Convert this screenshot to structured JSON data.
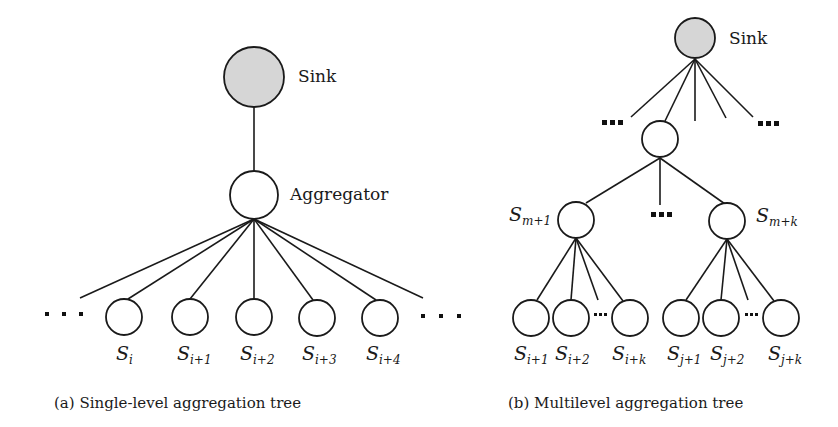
{
  "colors": {
    "sink_fill": "#d6d6d6",
    "node_fill": "#ffffff",
    "stroke": "#1a1a1a"
  },
  "diagram_a": {
    "caption": "(a) Single-level aggregation tree",
    "sink": {
      "label": "Sink",
      "cx": 254,
      "cy": 77,
      "r": 30
    },
    "aggregator": {
      "label": "Aggregator",
      "cx": 254,
      "cy": 195,
      "r": 24
    },
    "leaves": [
      {
        "cx": 124,
        "cy": 317,
        "r": 18,
        "var": "S",
        "sub": "i"
      },
      {
        "cx": 190,
        "cy": 317,
        "r": 18,
        "var": "S",
        "sub": "i+1"
      },
      {
        "cx": 254,
        "cy": 317,
        "r": 18,
        "var": "S",
        "sub": "i+2"
      },
      {
        "cx": 317,
        "cy": 318,
        "r": 18,
        "var": "S",
        "sub": "i+3"
      },
      {
        "cx": 380,
        "cy": 318,
        "r": 18,
        "var": "S",
        "sub": "i+4"
      }
    ],
    "ellipsis_left": "...",
    "ellipsis_right": "..."
  },
  "diagram_b": {
    "caption": "(b) Multilevel aggregation tree",
    "sink": {
      "label": "Sink",
      "cx": 695,
      "cy": 38,
      "r": 20
    },
    "intermediate": {
      "cx": 660,
      "cy": 139,
      "r": 18
    },
    "cluster_heads": [
      {
        "cx": 576,
        "cy": 220,
        "r": 18,
        "var": "S",
        "sub": "m+1"
      },
      {
        "cx": 727,
        "cy": 221,
        "r": 18,
        "var": "S",
        "sub": "m+k"
      }
    ],
    "leaves_left": [
      {
        "cx": 531,
        "cy": 318,
        "r": 18,
        "var": "S",
        "sub": "i+1"
      },
      {
        "cx": 571,
        "cy": 318,
        "r": 18,
        "var": "S",
        "sub": "i+2"
      },
      {
        "cx": 630,
        "cy": 318,
        "r": 18,
        "var": "S",
        "sub": "i+k"
      }
    ],
    "leaves_right": [
      {
        "cx": 681,
        "cy": 318,
        "r": 18,
        "var": "S",
        "sub": "j+1"
      },
      {
        "cx": 721,
        "cy": 318,
        "r": 18,
        "var": "S",
        "sub": "j+2"
      },
      {
        "cx": 781,
        "cy": 318,
        "r": 18,
        "var": "S",
        "sub": "j+k"
      }
    ],
    "ellipsis": "..."
  }
}
